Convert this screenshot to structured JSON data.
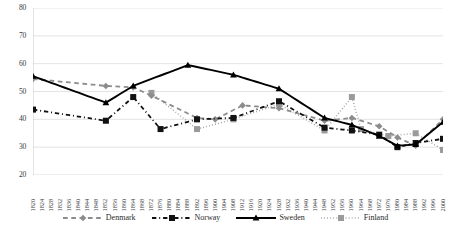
{
  "chart_data": {
    "type": "line",
    "title": "",
    "xlabel": "",
    "ylabel": "",
    "ylim": [
      20,
      80
    ],
    "xlim": [
      "1820",
      "2000"
    ],
    "grid": true,
    "legend_position": "bottom",
    "y_ticks": [
      "20",
      "30",
      "40",
      "50",
      "60",
      "70",
      "80"
    ],
    "categories": [
      "1820",
      "1822",
      "1824",
      "1826",
      "1828",
      "1830",
      "1832",
      "1834",
      "1836",
      "1838",
      "1840",
      "1842",
      "1844",
      "1846",
      "1848",
      "1850",
      "1852",
      "1854",
      "1856",
      "1858",
      "1860",
      "1862",
      "1864",
      "1866",
      "1868",
      "1870",
      "1872",
      "1874",
      "1876",
      "1878",
      "1880",
      "1882",
      "1884",
      "1886",
      "1888",
      "1890",
      "1892",
      "1894",
      "1896",
      "1898",
      "1900",
      "1902",
      "1904",
      "1906",
      "1908",
      "1910",
      "1912",
      "1914",
      "1916",
      "1918",
      "1920",
      "1922",
      "1924",
      "1926",
      "1928",
      "1930",
      "1932",
      "1934",
      "1936",
      "1938",
      "1940",
      "1942",
      "1944",
      "1946",
      "1948",
      "1950",
      "1952",
      "1954",
      "1956",
      "1958",
      "1960",
      "1962",
      "1964",
      "1966",
      "1968",
      "1970",
      "1972",
      "1974",
      "1976",
      "1978",
      "1980",
      "1982",
      "1984",
      "1986",
      "1988",
      "1990",
      "1992",
      "1994",
      "1996",
      "1998",
      "2000"
    ],
    "x_tick_labels": [
      "1820",
      "1824",
      "1828",
      "1832",
      "1836",
      "1840",
      "1844",
      "1848",
      "1852",
      "1856",
      "1860",
      "1864",
      "1868",
      "1872",
      "1876",
      "1880",
      "1884",
      "1888",
      "1892",
      "1896",
      "1900",
      "1904",
      "1908",
      "1912",
      "1916",
      "1920",
      "1924",
      "1928",
      "1932",
      "1936",
      "1940",
      "1944",
      "1948",
      "1952",
      "1956",
      "1960",
      "1964",
      "1968",
      "1972",
      "1976",
      "1980",
      "1984",
      "1988",
      "1992",
      "1996",
      "2000"
    ],
    "series": [
      {
        "name": "Denmark",
        "color": "#8c8c8c",
        "line_style": "dashed",
        "marker": "diamond",
        "x": [
          "1820",
          "1852",
          "1864",
          "1872",
          "1892",
          "1900",
          "1912",
          "1928",
          "1948",
          "1960",
          "1972",
          "1980",
          "1988",
          "2000"
        ],
        "values": [
          54.5,
          52.0,
          51.5,
          48.5,
          40.5,
          40.0,
          45.0,
          44.0,
          39.5,
          40.5,
          37.5,
          33.5,
          30.5,
          40.0
        ]
      },
      {
        "name": "Norway",
        "color": "#111111",
        "line_style": "dash-dot",
        "marker": "square",
        "x": [
          "1820",
          "1852",
          "1864",
          "1876",
          "1892",
          "1908",
          "1928",
          "1948",
          "1960",
          "1972",
          "1980",
          "1988",
          "2000"
        ],
        "values": [
          43.5,
          39.5,
          48.0,
          36.5,
          40.0,
          40.5,
          46.5,
          37.0,
          36.0,
          34.5,
          30.0,
          31.5,
          33.0
        ]
      },
      {
        "name": "Sweden",
        "color": "#000000",
        "line_style": "solid",
        "marker": "triangle",
        "x": [
          "1820",
          "1852",
          "1864",
          "1888",
          "1908",
          "1928",
          "1948",
          "1960",
          "1972",
          "1980",
          "1988",
          "2000"
        ],
        "values": [
          55.5,
          46.0,
          52.0,
          59.5,
          56.0,
          51.0,
          40.5,
          38.0,
          34.0,
          30.5,
          31.0,
          39.0
        ]
      },
      {
        "name": "Finland",
        "color": "#9a9a9a",
        "line_style": "dotted",
        "marker": "square",
        "x": [
          "1872",
          "1892",
          "1908",
          "1928",
          "1948",
          "1960",
          "1964",
          "1976",
          "1988",
          "2000"
        ],
        "values": [
          49.5,
          36.5,
          40.0,
          45.5,
          36.0,
          48.0,
          36.5,
          34.0,
          35.0,
          29.0
        ]
      }
    ]
  },
  "legend": {
    "items": [
      {
        "label": "Denmark"
      },
      {
        "label": "Norway"
      },
      {
        "label": "Sweden"
      },
      {
        "label": "Finland"
      }
    ]
  }
}
